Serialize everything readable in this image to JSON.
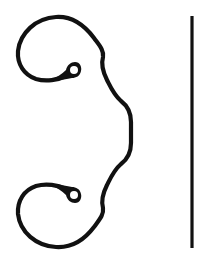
{
  "figure": {
    "background_color": "#ffffff",
    "stroke_color": "#111111",
    "elements": [
      {
        "name": "scroll-brace",
        "type": "curly-brace-with-scrolls",
        "orientation": "opening-right"
      },
      {
        "name": "vertical-line",
        "type": "line",
        "x": 192,
        "y_start": 16,
        "y_end": 248
      }
    ]
  }
}
